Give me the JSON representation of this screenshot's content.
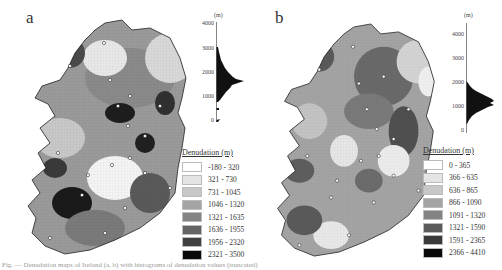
{
  "figure": {
    "panels": [
      {
        "id": "a",
        "label": "a",
        "map_subject": "Ireland denudation map",
        "histogram": {
          "unit": "(m)",
          "ticks": [
            "4000",
            "3000",
            "2000",
            "1000",
            "0"
          ],
          "peak_range": "approx 1000-2500"
        },
        "legend": {
          "title": "Denudation (m)",
          "classes": [
            {
              "label": "-180 - 320",
              "color": "#ffffff"
            },
            {
              "label": "321 - 730",
              "color": "#e4e4e4"
            },
            {
              "label": "731 - 1045",
              "color": "#c8c8c8"
            },
            {
              "label": "1046 - 1320",
              "color": "#a4a4a4"
            },
            {
              "label": "1321 - 1635",
              "color": "#848484"
            },
            {
              "label": "1636 - 1955",
              "color": "#646464"
            },
            {
              "label": "1956 - 2320",
              "color": "#404040"
            },
            {
              "label": "2321 - 3500",
              "color": "#0a0a0a"
            }
          ]
        }
      },
      {
        "id": "b",
        "label": "b",
        "map_subject": "Ireland denudation map",
        "histogram": {
          "unit": "(m)",
          "ticks": [
            "4000",
            "3000",
            "2000",
            "1000",
            "0"
          ],
          "peak_range": "approx 500-2000"
        },
        "legend": {
          "title": "Denudation (m)",
          "classes": [
            {
              "label": "0 - 365",
              "color": "#ffffff"
            },
            {
              "label": "366 - 635",
              "color": "#e4e4e4"
            },
            {
              "label": "636 - 865",
              "color": "#c8c8c8"
            },
            {
              "label": "866 - 1090",
              "color": "#a4a4a4"
            },
            {
              "label": "1091 - 1320",
              "color": "#848484"
            },
            {
              "label": "1321 - 1590",
              "color": "#5a5a5a"
            },
            {
              "label": "1591 - 2365",
              "color": "#3a3a3a"
            },
            {
              "label": "2366 - 4410",
              "color": "#0a0a0a"
            }
          ]
        }
      }
    ],
    "caption": "Fig. — Denudation maps of Ireland (a, b) with histograms of denudation values (truncated)"
  }
}
